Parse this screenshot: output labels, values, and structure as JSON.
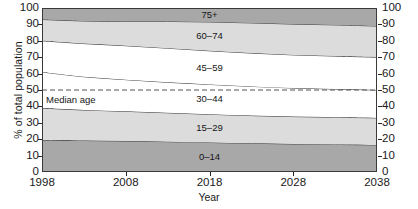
{
  "chart_data": {
    "type": "area",
    "title": "",
    "xlabel": "Year",
    "ylabel": "% of total population",
    "xlim": [
      1998,
      2038
    ],
    "ylim": [
      0,
      100
    ],
    "grid": false,
    "legend_position": "inline-band-labels",
    "stacked": true,
    "x": [
      1998,
      2003,
      2008,
      2013,
      2018,
      2023,
      2028,
      2033,
      2038
    ],
    "xticks": [
      "1998",
      "2008",
      "2018",
      "2028",
      "2038"
    ],
    "yticks": [
      "0",
      "10",
      "20",
      "30",
      "40",
      "50",
      "60",
      "70",
      "80",
      "90",
      "100"
    ],
    "series": [
      {
        "name": "0-14",
        "label": "0–14",
        "color": "#a8a8a8",
        "values": [
          19.5,
          19.2,
          18.9,
          18.5,
          18.0,
          17.5,
          17.1,
          16.8,
          16.5
        ]
      },
      {
        "name": "15-29",
        "label": "15–29",
        "color": "#dcdcdc",
        "values": [
          19.5,
          18.6,
          18.1,
          17.6,
          17.2,
          16.9,
          16.7,
          16.6,
          16.5
        ]
      },
      {
        "name": "30-44",
        "label": "30–44",
        "color": "#ffffff",
        "values": [
          22.0,
          20.3,
          19.3,
          18.6,
          18.2,
          17.8,
          17.4,
          17.2,
          17.0
        ]
      },
      {
        "name": "45-59",
        "label": "45–59",
        "color": "#ffffff",
        "values": [
          19.0,
          20.2,
          20.7,
          20.8,
          20.5,
          20.3,
          20.2,
          20.1,
          20.0
        ]
      },
      {
        "name": "60-74",
        "label": "60–74",
        "color": "#dcdcdc",
        "values": [
          13.0,
          13.8,
          14.8,
          16.3,
          17.6,
          18.4,
          18.8,
          19.0,
          19.0
        ]
      },
      {
        "name": "75+",
        "label": "75+",
        "color": "#a8a8a8",
        "values": [
          7.0,
          7.9,
          8.2,
          8.2,
          8.5,
          9.1,
          9.8,
          10.3,
          11.0
        ]
      }
    ],
    "cumulative_boundaries": {
      "top_of_0_14": [
        19.5,
        19.2,
        18.9,
        18.5,
        18.0,
        17.5,
        17.1,
        16.8,
        16.5
      ],
      "top_of_15_29": [
        39.0,
        37.8,
        37.0,
        36.1,
        35.2,
        34.4,
        33.8,
        33.4,
        33.0
      ],
      "top_of_30_44": [
        61.0,
        58.1,
        56.3,
        54.7,
        53.4,
        52.2,
        51.2,
        50.6,
        50.0
      ],
      "top_of_45_59": [
        80.0,
        78.3,
        77.0,
        75.5,
        73.9,
        72.5,
        71.4,
        70.7,
        70.0
      ],
      "top_of_60_74": [
        93.0,
        92.1,
        91.8,
        91.8,
        91.5,
        90.9,
        90.2,
        89.7,
        89.0
      ],
      "top_of_75": [
        100,
        100,
        100,
        100,
        100,
        100,
        100,
        100,
        100
      ]
    },
    "annotations": [
      {
        "name": "median-age",
        "text": "Median age",
        "type": "dashed-line",
        "y_value": 50,
        "color": "#555555"
      }
    ]
  },
  "axes": {
    "y_title": "% of total population",
    "x_title": "Year"
  }
}
